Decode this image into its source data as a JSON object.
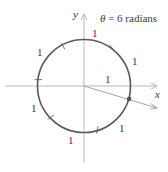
{
  "diagram": {
    "title": "θ = 6 radians",
    "title_parts": {
      "theta": "θ",
      "rest": " = 6 radians"
    },
    "axes": {
      "x_label": "x",
      "y_label": "y"
    },
    "radius_label": "1",
    "arc_labels": [
      "1",
      "1",
      "1",
      "1",
      "1",
      "1"
    ],
    "angle_radians": 6,
    "colors": {
      "circle": "#555555",
      "axis": "#9a9a9a",
      "ray": "#777777",
      "point": "#555555"
    }
  }
}
